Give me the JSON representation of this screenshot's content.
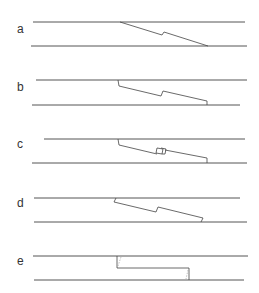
{
  "figure": {
    "panels": [
      {
        "label": "a",
        "top_y": 22,
        "bottom_y": 46
      },
      {
        "label": "b",
        "top_y": 80,
        "bottom_y": 105
      },
      {
        "label": "c",
        "top_y": 139,
        "bottom_y": 163
      },
      {
        "label": "d",
        "top_y": 198,
        "bottom_y": 222
      },
      {
        "label": "e",
        "top_y": 256,
        "bottom_y": 280
      }
    ],
    "colors": {
      "line": "#555555",
      "text": "#333333",
      "background": "#ffffff"
    }
  }
}
